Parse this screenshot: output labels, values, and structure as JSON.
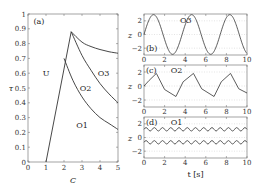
{
  "chart_data": [
    {
      "type": "line",
      "panel": "(a)",
      "title": "",
      "xlabel": "C",
      "ylabel": "τ",
      "xlim": [
        0,
        5
      ],
      "ylim": [
        0,
        1
      ],
      "xticks": [
        "0",
        "1",
        "2",
        "3",
        "4",
        "5"
      ],
      "yticks": [
        "0",
        "0.1",
        "0.2",
        "0.3",
        "0.4",
        "0.5",
        "0.6",
        "0.7",
        "0.8",
        "0.9",
        "1"
      ],
      "series": [
        {
          "name": "U/O boundary",
          "x": [
            1.0,
            2.4
          ],
          "y": [
            0.0,
            0.88
          ]
        },
        {
          "name": "O1/O2 boundary",
          "x": [
            2.0,
            2.5,
            3,
            3.5,
            4,
            4.5,
            5
          ],
          "y": [
            0.7,
            0.55,
            0.44,
            0.36,
            0.3,
            0.26,
            0.22
          ]
        },
        {
          "name": "O2/O3 boundary",
          "x": [
            2.4,
            3,
            3.5,
            4,
            4.5,
            5
          ],
          "y": [
            0.88,
            0.72,
            0.62,
            0.53,
            0.46,
            0.4
          ]
        },
        {
          "name": "O3 upper boundary",
          "x": [
            2.4,
            3,
            3.5,
            4,
            4.5,
            5
          ],
          "y": [
            0.88,
            0.81,
            0.78,
            0.76,
            0.745,
            0.735
          ]
        }
      ],
      "annotations": [
        {
          "text": "(a)",
          "x": 0.3,
          "y": 0.95
        },
        {
          "text": "U",
          "x": 1.0,
          "y": 0.6
        },
        {
          "text": "O1",
          "x": 3.0,
          "y": 0.25
        },
        {
          "text": "O2",
          "x": 3.2,
          "y": 0.5
        },
        {
          "text": "O3",
          "x": 4.2,
          "y": 0.6
        }
      ],
      "grid": false
    },
    {
      "type": "line",
      "panel": "(b)",
      "label": "O3",
      "xlabel": "",
      "ylabel": "z",
      "xlim": [
        0,
        10
      ],
      "ylim": [
        -3,
        3
      ],
      "xticks": [
        "0",
        "2",
        "4",
        "6",
        "8",
        "10"
      ],
      "yticks": [
        "-2",
        "0",
        "2"
      ],
      "series": [
        {
          "name": "z(t)",
          "description": "large sinusoid, amplitude ~2.9, period ~3.7 s",
          "x": [
            0,
            0.9,
            2.8,
            4.6,
            6.5,
            8.3,
            10
          ],
          "y": [
            0,
            2.9,
            -2.9,
            2.9,
            -2.9,
            2.9,
            -2.2
          ]
        }
      ],
      "grid": true
    },
    {
      "type": "line",
      "panel": "(c)",
      "label": "O2",
      "xlabel": "",
      "ylabel": "z",
      "xlim": [
        0,
        10
      ],
      "ylim": [
        -3,
        3
      ],
      "xticks": [
        "0",
        "2",
        "4",
        "6",
        "8",
        "10"
      ],
      "yticks": [
        "-2",
        "0",
        "2"
      ],
      "series": [
        {
          "name": "z(t)",
          "description": "piecewise-linear oscillation, amplitude ~1.8, period ~3.7 s",
          "x": [
            0,
            0.5,
            1.2,
            2,
            3.1,
            3.8,
            4.8,
            5.6,
            6.8,
            7.5,
            8.4,
            9.2,
            10
          ],
          "y": [
            0,
            0.8,
            1.8,
            -0.5,
            -1.5,
            0.6,
            1.8,
            -0.4,
            -1.5,
            0.6,
            1.8,
            -0.4,
            -1.0
          ]
        }
      ],
      "grid": true
    },
    {
      "type": "line",
      "panel": "(d)",
      "label": "O1",
      "xlabel": "t [s]",
      "ylabel": "z",
      "xlim": [
        0,
        10
      ],
      "ylim": [
        -3,
        3
      ],
      "xticks": [
        "0",
        "2",
        "4",
        "6",
        "8",
        "10"
      ],
      "yticks": [
        "-2",
        "0",
        "2"
      ],
      "series": [
        {
          "name": "upper",
          "description": "small oscillation around z≈1.2, amplitude ~0.25",
          "mean": 1.2,
          "amplitude": 0.25,
          "period": 0.8
        },
        {
          "name": "lower",
          "description": "small oscillation around z≈-0.7, amplitude ~0.25",
          "mean": -0.7,
          "amplitude": 0.25,
          "period": 0.8
        }
      ],
      "grid": true
    }
  ],
  "labels": {
    "a": "(a)",
    "b": "(b)",
    "c": "(c)",
    "d": "(d)",
    "U": "U",
    "O1": "O1",
    "O2": "O2",
    "O3": "O3",
    "xlabel_a": "C",
    "ylabel_a": "τ",
    "ylabel_z": "z",
    "xlabel_t": "t [s]"
  }
}
